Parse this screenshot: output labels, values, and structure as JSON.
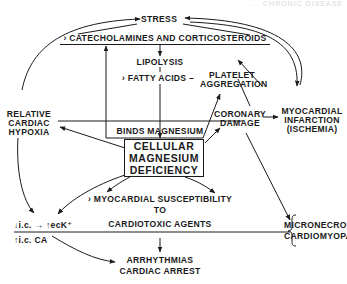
{
  "header": {
    "faint_text": "... CHRONIC DISEASE"
  },
  "nodes": {
    "stress": "STRESS",
    "catecholamines": "› CATECHOLAMINES AND CORTICOSTEROIDS",
    "lipolysis": "LIPOLYSIS",
    "fatty_acids": "› FATTY ACIDS –",
    "platelet_line1": "PLATELET",
    "platelet_line2": "AGGREGATION",
    "relative_line1": "RELATIVE",
    "relative_line2": "CARDIAC",
    "relative_line3": "HYPOXIA",
    "binds_magnesium": "BINDS MAGNESIUM",
    "coronary_line1": "CORONARY",
    "coronary_line2": "DAMAGE",
    "mi_line1": "MYOCARDIAL",
    "mi_line2": "INFARCTION",
    "mi_line3": "(ISCHEMIA)",
    "cmd_line1": "CELLULAR",
    "cmd_line2": "MAGNESIUM",
    "cmd_line3": "DEFICIENCY",
    "susc_line1": "› MYOCARDIAL SUSCEPTIBILITY",
    "susc_line2": "TO",
    "susc_line3": "CARDIOTOXIC AGENTS",
    "ion_line1": "↓i.c. → ↑ecK⁺",
    "ion_line2": "↑i.c. CA",
    "micro_line1": "MICRONECROSIS,",
    "micro_line2": "CARDIOMYOPATHY",
    "arrhythmias_line1": "ARRHYTHMIAS",
    "arrhythmias_line2": "CARDIAC ARREST"
  },
  "colors": {
    "ink": "#1a1a1a",
    "background": "#ffffff"
  }
}
